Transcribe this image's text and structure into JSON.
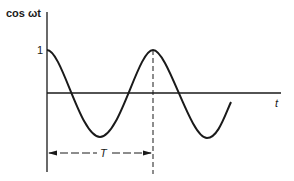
{
  "diagram": {
    "y_axis_label": "cos ωt",
    "x_axis_label": "t",
    "amplitude_tick_label": "1",
    "period_label": "T",
    "curve": "cosine",
    "periods_shown": 1.75,
    "colors": {
      "ink": "#1a1a1a",
      "background": "#ffffff"
    }
  }
}
